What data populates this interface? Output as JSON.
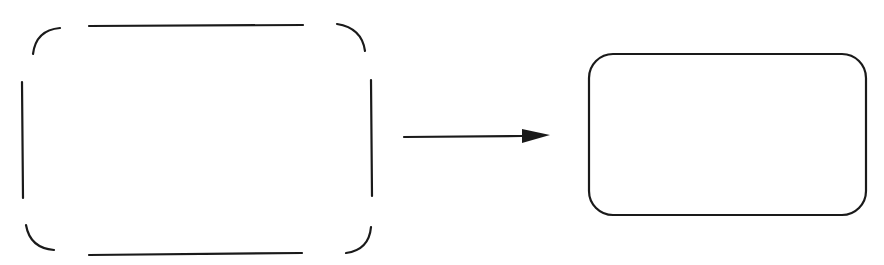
{
  "diagram": {
    "colors": {
      "background": "#ffffff",
      "stroke": "#1a1a1a"
    },
    "stroke_width": 2.2,
    "source_shape": {
      "label": "",
      "type": "broken-rounded-rectangle",
      "segments": {
        "top": {
          "x1": 89,
          "y1": 26,
          "x2": 303,
          "y2": 25
        },
        "bottom": {
          "x1": 89,
          "y1": 255,
          "x2": 302,
          "y2": 253
        },
        "left": {
          "x1": 22,
          "y1": 82,
          "x2": 23,
          "y2": 198
        },
        "right": {
          "x1": 371,
          "y1": 80,
          "x2": 372,
          "y2": 196
        },
        "corner_top_left": "M 33 54 Q 36 30 60 28",
        "corner_top_right": "M 337 24 Q 362 28 365 51",
        "corner_bottom_left": "M 26 225 Q 30 248 54 250",
        "corner_bottom_right": "M 371 227 Q 369 250 346 253"
      }
    },
    "arrow": {
      "label": "",
      "x1": 404,
      "y1": 137,
      "x2": 522,
      "y2": 136,
      "head": "522,129 550,135 522,143"
    },
    "target_shape": {
      "label": "",
      "type": "rounded-rectangle",
      "x": 589,
      "y": 54,
      "width": 277,
      "height": 161,
      "rx": 24
    }
  }
}
